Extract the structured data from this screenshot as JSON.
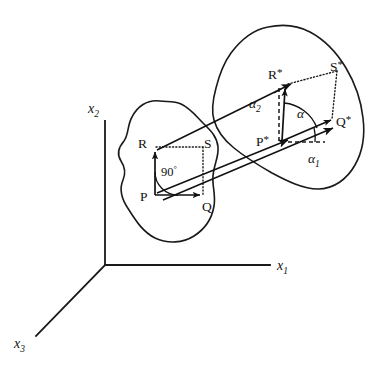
{
  "figure": {
    "background_color": "#ffffff",
    "line_color": "#1a1a1a"
  },
  "axes": {
    "x1": {
      "label": "x",
      "sub": "1"
    },
    "x2": {
      "label": "x",
      "sub": "2"
    },
    "x3": {
      "label": "x",
      "sub": "3"
    }
  },
  "points": {
    "P": "P",
    "Q": "Q",
    "R": "R",
    "S": "S",
    "P_star": "P",
    "Q_star": "Q",
    "R_star": "R",
    "S_star": "S",
    "star_mark": "*"
  },
  "angles": {
    "right_angle": "90",
    "degree_symbol": "°",
    "alpha": "α",
    "alpha1": {
      "sym": "α",
      "sub": "1"
    },
    "alpha2": {
      "sym": "α",
      "sub": "2"
    }
  },
  "shapes": {
    "undeformed_body": "undeformed-body-outline",
    "deformed_body": "deformed-body-outline"
  }
}
